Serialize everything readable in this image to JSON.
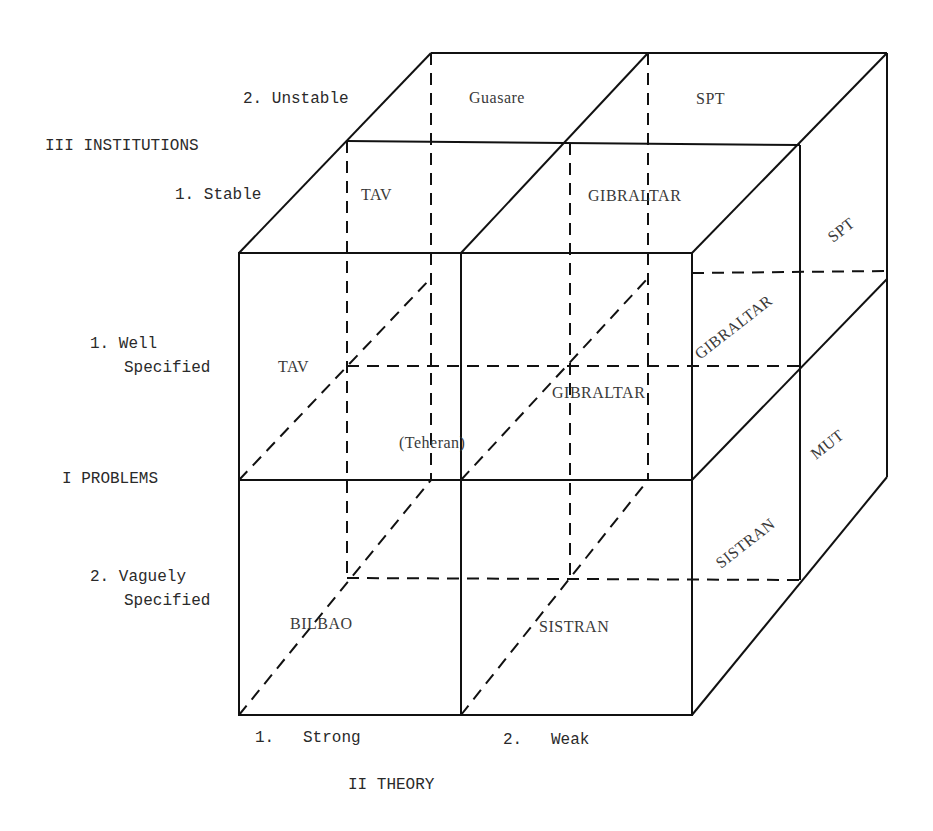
{
  "axes": {
    "problems": {
      "title": "I PROBLEMS",
      "levels": [
        "1. Well",
        "Specified",
        "2. Vaguely",
        "Specified"
      ]
    },
    "theory": {
      "title": "II THEORY",
      "levels": [
        "1.   Strong",
        "2.   Weak"
      ]
    },
    "institutions": {
      "title": "III INSTITUTIONS",
      "levels": [
        "1. Stable",
        "2. Unstable"
      ]
    }
  },
  "cells": {
    "top_unstable_strong": "Guasare",
    "top_unstable_weak": "SPT",
    "top_stable_strong": "TAV",
    "top_stable_weak": "GIBRALTAR",
    "front_well_strong": "TAV",
    "front_well_weak_inner": "GIBRALTAR",
    "front_center": "(Teheran)",
    "front_vague_strong": "BILBAO",
    "front_vague_weak": "SISTRAN",
    "side_upper_back": "SPT",
    "side_upper_front": "GIBRALTAR",
    "side_lower_back": "MUT",
    "side_lower_front": "SISTRAN"
  }
}
